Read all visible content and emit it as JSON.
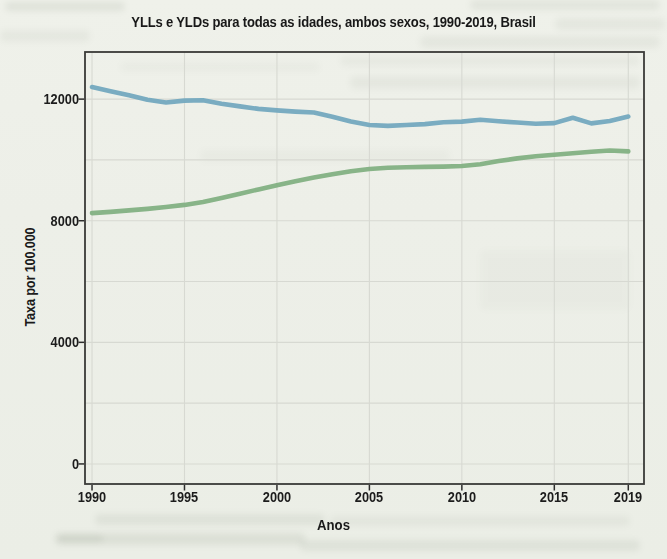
{
  "chart_data": {
    "type": "line",
    "title": "YLLs e YLDs para todas as idades, ambos sexos, 1990-2019, Brasil",
    "xlabel": "Anos",
    "ylabel": "Taxa por 100.000",
    "x": [
      1990,
      1991,
      1992,
      1993,
      1994,
      1995,
      1996,
      1997,
      1998,
      1999,
      2000,
      2001,
      2002,
      2003,
      2004,
      2005,
      2006,
      2007,
      2008,
      2009,
      2010,
      2011,
      2012,
      2013,
      2014,
      2015,
      2016,
      2017,
      2018,
      2019
    ],
    "series": [
      {
        "name": "linha azul (YLLs)",
        "color": "#74a9bf",
        "values": [
          12400,
          12260,
          12130,
          11980,
          11890,
          11950,
          11960,
          11850,
          11760,
          11680,
          11630,
          11590,
          11560,
          11420,
          11260,
          11150,
          11120,
          11150,
          11180,
          11240,
          11260,
          11320,
          11270,
          11230,
          11190,
          11210,
          11390,
          11200,
          11280,
          11430
        ]
      },
      {
        "name": "linha verde (YLDs)",
        "color": "#83b183",
        "values": [
          8250,
          8290,
          8340,
          8390,
          8450,
          8520,
          8620,
          8750,
          8890,
          9030,
          9170,
          9300,
          9420,
          9530,
          9630,
          9700,
          9740,
          9760,
          9770,
          9780,
          9800,
          9860,
          9960,
          10050,
          10120,
          10170,
          10220,
          10270,
          10310,
          10280
        ]
      }
    ],
    "xticks": {
      "values": [
        1990,
        1995,
        2000,
        2005,
        2010,
        2015,
        2019
      ],
      "labels": [
        "1990",
        "1995",
        "2000",
        "2005",
        "2010",
        "2015",
        "2019"
      ]
    },
    "yticks": {
      "values": [
        0,
        4000,
        8000,
        12000
      ],
      "labels": [
        "0",
        "4000",
        "8000",
        "12000"
      ]
    },
    "grid_x": [
      1990,
      1995,
      2000,
      2005,
      2010,
      2015,
      2019
    ],
    "grid_y": [
      0,
      2000,
      4000,
      6000,
      8000,
      10000,
      12000
    ],
    "xlim": [
      1989.62,
      2019.85
    ],
    "ylim": [
      -660,
      13550
    ],
    "grid": true,
    "legend_position": "none",
    "style": {
      "line_blue": "#74a9bf",
      "line_green": "#83b183",
      "grid_color": "#d7d9d2",
      "frame_color": "#3a3a38",
      "paper_color": "#edefe8",
      "ink_color": "#1a1a1a"
    }
  }
}
